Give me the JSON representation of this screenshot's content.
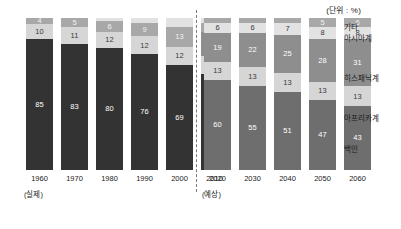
{
  "chart_data": {
    "type": "bar",
    "title": "",
    "unit_note": "(단위 : %)",
    "xlabel": "",
    "ylabel": "",
    "ylim": [
      0,
      100
    ],
    "grid": false,
    "stacked": true,
    "orientation": "vertical",
    "legend_position": "right",
    "categories": [
      "1960",
      "1970",
      "1980",
      "1990",
      "2000",
      "2010",
      "2020",
      "2030",
      "2040",
      "2050",
      "2060"
    ],
    "groups": [
      {
        "name": "actual",
        "note": "(실제)",
        "categories": [
          "1960",
          "1970",
          "1980",
          "1990",
          "2000",
          "2010"
        ]
      },
      {
        "name": "projected",
        "note": "(예상)",
        "categories": [
          "2020",
          "2030",
          "2040",
          "2050",
          "2060"
        ]
      }
    ],
    "series": [
      {
        "name": "기타",
        "key": "other",
        "color": "#a8a8a8",
        "values": [
          4,
          5,
          6,
          9,
          13,
          5,
          2,
          2,
          2,
          5,
          6
        ]
      },
      {
        "name": "아시아계",
        "key": "asian",
        "color": "#e2e2e2",
        "values": [
          null,
          null,
          null,
          null,
          null,
          16,
          6,
          6,
          7,
          8,
          8
        ]
      },
      {
        "name": "히스패닉계",
        "key": "hispanic",
        "color": "#8e8e8e",
        "values": [
          null,
          null,
          null,
          null,
          null,
          null,
          19,
          22,
          25,
          28,
          31
        ]
      },
      {
        "name": "아프리카계",
        "key": "african",
        "color": "#d6d6d6",
        "values": [
          10,
          11,
          12,
          12,
          12,
          12,
          13,
          13,
          13,
          13,
          13
        ]
      },
      {
        "name": "백인",
        "key": "white",
        "color": "#333333",
        "values": [
          85,
          83,
          80,
          76,
          69,
          64,
          60,
          55,
          51,
          47,
          43
        ]
      }
    ],
    "bars": [
      {
        "category": "1960",
        "group": "actual",
        "segments": [
          {
            "series": "기타",
            "value": 4,
            "label": "4",
            "style": "s-other",
            "height_pct": 4
          },
          {
            "series": "아프리카계",
            "value": 10,
            "label": "10",
            "style": "s-afri",
            "height_pct": 10
          },
          {
            "series": "백인",
            "value": 85,
            "label": "85",
            "style": "s-white-d",
            "height_pct": 86
          }
        ]
      },
      {
        "category": "1970",
        "group": "actual",
        "segments": [
          {
            "series": "기타",
            "value": 5,
            "label": "5",
            "style": "s-other",
            "height_pct": 6
          },
          {
            "series": "아프리카계",
            "value": 11,
            "label": "11",
            "style": "s-afri",
            "height_pct": 11
          },
          {
            "series": "백인",
            "value": 83,
            "label": "83",
            "style": "s-white-d",
            "height_pct": 83
          }
        ]
      },
      {
        "category": "1980",
        "group": "actual",
        "segments": [
          {
            "series": "기타",
            "value": 2,
            "label": "",
            "style": "s-asian",
            "height_pct": 2
          },
          {
            "series": "기타",
            "value": 6,
            "label": "6",
            "style": "s-other",
            "height_pct": 7
          },
          {
            "series": "아프리카계",
            "value": 12,
            "label": "12",
            "style": "s-afri",
            "height_pct": 11
          },
          {
            "series": "백인",
            "value": 80,
            "label": "80",
            "style": "s-white-d",
            "height_pct": 80
          }
        ]
      },
      {
        "category": "1990",
        "group": "actual",
        "segments": [
          {
            "series": "기타",
            "value": 3,
            "label": "",
            "style": "s-asian",
            "height_pct": 3
          },
          {
            "series": "기타",
            "value": 9,
            "label": "9",
            "style": "s-other",
            "height_pct": 9
          },
          {
            "series": "아프리카계",
            "value": 12,
            "label": "12",
            "style": "s-afri",
            "height_pct": 12
          },
          {
            "series": "백인",
            "value": 76,
            "label": "76",
            "style": "s-white-d",
            "height_pct": 76
          }
        ]
      },
      {
        "category": "2000",
        "group": "actual",
        "segments": [
          {
            "series": "기타",
            "value": 6,
            "label": "",
            "style": "s-asian",
            "height_pct": 6
          },
          {
            "series": "기타",
            "value": 13,
            "label": "13",
            "style": "s-other",
            "height_pct": 13
          },
          {
            "series": "아프리카계",
            "value": 12,
            "label": "12",
            "style": "s-afri",
            "height_pct": 12
          },
          {
            "series": "백인",
            "value": 69,
            "label": "69",
            "style": "s-white-d",
            "height_pct": 69
          }
        ]
      },
      {
        "category": "2010",
        "group": "actual",
        "segments": [
          {
            "series": "기타",
            "value": 3,
            "label": "",
            "style": "s-asian",
            "height_pct": 3
          },
          {
            "series": "기타",
            "value": 5,
            "label": "5",
            "style": "s-other",
            "height_pct": 6
          },
          {
            "series": "히스패닉계",
            "value": 16,
            "label": "16",
            "style": "s-hisp",
            "height_pct": 16
          },
          {
            "series": "아프리카계",
            "value": 12,
            "label": "12",
            "style": "s-afri",
            "height_pct": 12
          },
          {
            "series": "백인",
            "value": 64,
            "label": "64",
            "style": "s-white-d",
            "height_pct": 63
          }
        ]
      },
      {
        "category": "2020",
        "group": "projected",
        "segments": [
          {
            "series": "기타",
            "value": 2,
            "label": "",
            "style": "s-other",
            "height_pct": 3
          },
          {
            "series": "아시아계",
            "value": 6,
            "label": "6",
            "style": "s-asian",
            "height_pct": 7
          },
          {
            "series": "히스패닉계",
            "value": 19,
            "label": "19",
            "style": "s-hisp",
            "height_pct": 19
          },
          {
            "series": "아프리카계",
            "value": 13,
            "label": "13",
            "style": "s-afri",
            "height_pct": 12
          },
          {
            "series": "백인",
            "value": 60,
            "label": "60",
            "style": "s-white-g",
            "height_pct": 59
          }
        ]
      },
      {
        "category": "2030",
        "group": "projected",
        "segments": [
          {
            "series": "기타",
            "value": 2,
            "label": "",
            "style": "s-other",
            "height_pct": 3
          },
          {
            "series": "아시아계",
            "value": 6,
            "label": "6",
            "style": "s-asian",
            "height_pct": 7
          },
          {
            "series": "히스패닉계",
            "value": 22,
            "label": "22",
            "style": "s-hisp",
            "height_pct": 22
          },
          {
            "series": "아프리카계",
            "value": 13,
            "label": "13",
            "style": "s-afri",
            "height_pct": 13
          },
          {
            "series": "백인",
            "value": 55,
            "label": "55",
            "style": "s-white-g",
            "height_pct": 55
          }
        ]
      },
      {
        "category": "2040",
        "group": "projected",
        "segments": [
          {
            "series": "기타",
            "value": 2,
            "label": "",
            "style": "s-other",
            "height_pct": 3
          },
          {
            "series": "아시아계",
            "value": 7,
            "label": "7",
            "style": "s-asian",
            "height_pct": 8
          },
          {
            "series": "히스패닉계",
            "value": 25,
            "label": "25",
            "style": "s-hisp",
            "height_pct": 25
          },
          {
            "series": "아프리카계",
            "value": 13,
            "label": "13",
            "style": "s-afri",
            "height_pct": 13
          },
          {
            "series": "백인",
            "value": 51,
            "label": "51",
            "style": "s-white-g",
            "height_pct": 51
          }
        ]
      },
      {
        "category": "2050",
        "group": "projected",
        "segments": [
          {
            "series": "기타",
            "value": 5,
            "label": "5",
            "style": "s-other",
            "height_pct": 6
          },
          {
            "series": "아시아계",
            "value": 8,
            "label": "8",
            "style": "s-asian",
            "height_pct": 8
          },
          {
            "series": "히스패닉계",
            "value": 28,
            "label": "28",
            "style": "s-hisp",
            "height_pct": 28
          },
          {
            "series": "아프리카계",
            "value": 13,
            "label": "13",
            "style": "s-afri",
            "height_pct": 12
          },
          {
            "series": "백인",
            "value": 47,
            "label": "47",
            "style": "s-white-g",
            "height_pct": 46
          }
        ]
      },
      {
        "category": "2060",
        "group": "projected",
        "segments": [
          {
            "series": "기타",
            "value": 6,
            "label": "6",
            "style": "s-other",
            "height_pct": 6
          },
          {
            "series": "아시아계",
            "value": 8,
            "label": "8",
            "style": "s-asian",
            "height_pct": 8
          },
          {
            "series": "히스패닉계",
            "value": 31,
            "label": "31",
            "style": "s-hisp",
            "height_pct": 31
          },
          {
            "series": "아프리카계",
            "value": 13,
            "label": "13",
            "style": "s-afri",
            "height_pct": 13
          },
          {
            "series": "백인",
            "value": 43,
            "label": "43",
            "style": "s-white-g",
            "height_pct": 42
          }
        ]
      }
    ],
    "legend": [
      {
        "label": "기타",
        "top": 6
      },
      {
        "label": "아시아계",
        "top": 17
      },
      {
        "label": "히스패닉계",
        "top": 57
      },
      {
        "label": "아프리카계",
        "top": 97
      },
      {
        "label": "백인",
        "top": 128
      }
    ]
  }
}
